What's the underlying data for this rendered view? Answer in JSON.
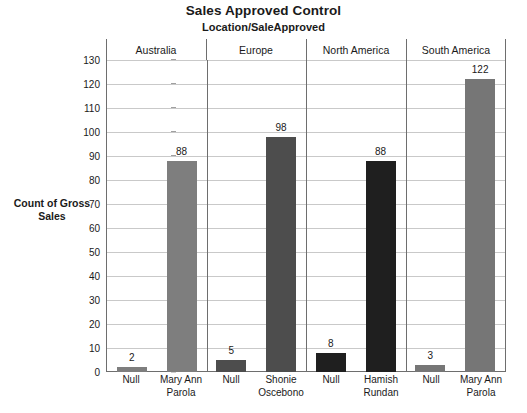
{
  "chart_data": {
    "type": "bar",
    "title": "Sales Approved Control",
    "subtitle": "Location/SaleApproved",
    "xlabel": "",
    "ylabel": "Count of Gross Sales",
    "ylim": [
      0,
      130
    ],
    "ytick_step": 10,
    "yticks": [
      130,
      120,
      110,
      100,
      90,
      80,
      70,
      60,
      50,
      40,
      30,
      20,
      10,
      0
    ],
    "grid": true,
    "legend": "none",
    "panel_variable": "Location",
    "panels": [
      {
        "name": "Australia",
        "categories": [
          "Null",
          "Mary Ann Parola"
        ],
        "values": [
          2,
          88
        ],
        "bar_color": "#7e7e7e"
      },
      {
        "name": "Europe",
        "categories": [
          "Null",
          "Shonie Oscebono"
        ],
        "values": [
          5,
          98
        ],
        "bar_color": "#4d4d4d"
      },
      {
        "name": "North America",
        "categories": [
          "Null",
          "Hamish Rundan"
        ],
        "values": [
          8,
          88
        ],
        "bar_color": "#1f1f1f"
      },
      {
        "name": "South America",
        "categories": [
          "Null",
          "Mary Ann Parola"
        ],
        "values": [
          3,
          122
        ],
        "bar_color": "#767676"
      }
    ],
    "colors": {
      "axis": "#6e6e6e",
      "gridline": "#c9c9c9",
      "text": "#1a1a1a",
      "background": "#ffffff"
    }
  }
}
